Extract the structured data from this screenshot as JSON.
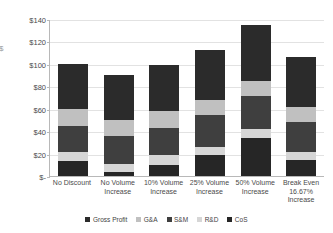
{
  "chart_data": {
    "type": "bar",
    "subtype": "stacked-column",
    "title": "",
    "xlabel": "",
    "ylabel": "$",
    "ylim": [
      0,
      140
    ],
    "ytick_values": [
      0,
      20,
      40,
      60,
      80,
      100,
      120,
      140
    ],
    "ytick_labels": [
      "$-",
      "$20",
      "$40",
      "$60",
      "$80",
      "$100",
      "$120",
      "$140"
    ],
    "grid": true,
    "legend_position": "bottom",
    "categories": [
      "No Discount",
      "No Volume Increase",
      "10% Volume Increase",
      "25% Volume Increase",
      "50% Volume Increase",
      "Break Even 16.67% Increase"
    ],
    "category_lines": [
      [
        "No Discount"
      ],
      [
        "No Volume",
        "Increase"
      ],
      [
        "10% Volume",
        "Increase"
      ],
      [
        "25% Volume",
        "Increase"
      ],
      [
        "50% Volume",
        "Increase"
      ],
      [
        "Break Even",
        "16.67%",
        "Increase"
      ]
    ],
    "stack_order_bottom_to_top": [
      "CoS",
      "R&D",
      "S&M",
      "G&A",
      "Gross Profit"
    ],
    "series": [
      {
        "name": "CoS",
        "color": "#262626",
        "values": [
          13,
          4,
          10,
          19,
          34,
          14
        ]
      },
      {
        "name": "R&D",
        "color": "#d6d6d6",
        "values": [
          8,
          7,
          9,
          7,
          8,
          7
        ]
      },
      {
        "name": "S&M",
        "color": "#3f3f3f",
        "values": [
          24,
          25,
          24,
          28,
          29,
          27
        ]
      },
      {
        "name": "G&A",
        "color": "#c0c0c0",
        "values": [
          15,
          14,
          15,
          14,
          14,
          14
        ]
      },
      {
        "name": "Gross Profit",
        "color": "#2b2b2b",
        "values": [
          40,
          40,
          41,
          44.5,
          50,
          44
        ]
      }
    ],
    "totals": [
      100,
      90,
      99,
      112.5,
      135,
      106
    ]
  },
  "legend": {
    "items": [
      {
        "label": "Gross Profit",
        "color": "#2b2b2b"
      },
      {
        "label": "G&A",
        "color": "#c0c0c0"
      },
      {
        "label": "S&M",
        "color": "#3f3f3f"
      },
      {
        "label": "R&D",
        "color": "#d6d6d6"
      },
      {
        "label": "CoS",
        "color": "#262626"
      }
    ]
  },
  "colors": {
    "gridline": "#e2e2e2",
    "axis": "#b8b8b8",
    "text": "#4a4a4a",
    "background": "#ffffff"
  }
}
